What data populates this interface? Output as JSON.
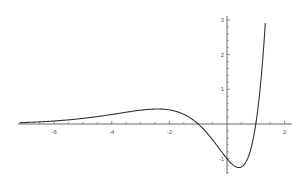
{
  "chart_data": {
    "type": "line",
    "title": "",
    "xlabel": "",
    "ylabel": "",
    "xlim": [
      -7.2,
      2.25
    ],
    "ylim": [
      -1.45,
      3.1
    ],
    "grid": false,
    "legend": null,
    "x_ticks": [
      -6,
      -4,
      -2,
      2
    ],
    "x_tick_labels": [
      "-6",
      "-4",
      "-2",
      "2"
    ],
    "y_ticks": [
      -1,
      1,
      2,
      3
    ],
    "y_tick_labels": [
      "-1",
      "1",
      "2",
      "3"
    ],
    "series": [
      {
        "name": "f(x)",
        "expression": "(x^2 - 1) * e^x",
        "color": "#333333",
        "x": [
          -7.2,
          -7,
          -6.5,
          -6,
          -5.5,
          -5,
          -4.5,
          -4,
          -3.5,
          -3,
          -2.7,
          -2.414,
          -2.2,
          -2,
          -1.75,
          -1.5,
          -1.25,
          -1,
          -0.75,
          -0.5,
          -0.25,
          0,
          0.2,
          0.414,
          0.6,
          0.8,
          1,
          1.1,
          1.2,
          1.3,
          1.33
        ],
        "y": [
          0.039,
          0.044,
          0.063,
          0.087,
          0.119,
          0.162,
          0.213,
          0.275,
          0.341,
          0.398,
          0.422,
          0.432,
          0.427,
          0.406,
          0.354,
          0.28,
          0.161,
          0.0,
          -0.206,
          -0.455,
          -0.73,
          -1.0,
          -1.173,
          -1.254,
          -1.166,
          -0.801,
          0.0,
          0.631,
          1.455,
          2.529,
          2.901
        ]
      }
    ],
    "annotations": []
  },
  "axes": {
    "x_axis_color": "#444444",
    "y_axis_color": "#444444",
    "line_color": "#333333"
  }
}
